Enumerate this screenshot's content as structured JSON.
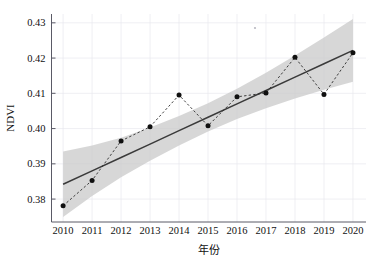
{
  "chart_data": {
    "type": "line",
    "title": "",
    "subtitle": "",
    "xlabel": "年份",
    "ylabel": "NDVI",
    "x": [
      2010,
      2011,
      2012,
      2013,
      2014,
      2015,
      2016,
      2017,
      2018,
      2019,
      2020
    ],
    "categories": [
      "2010",
      "2011",
      "2012",
      "2013",
      "2014",
      "2015",
      "2016",
      "2017",
      "2018",
      "2019",
      "2020"
    ],
    "xlim": [
      2009.6,
      2020.45
    ],
    "ylim": [
      0.3735,
      0.4325
    ],
    "xticks": [
      2010,
      2011,
      2012,
      2013,
      2014,
      2015,
      2016,
      2017,
      2018,
      2019,
      2020
    ],
    "xtick_labels": [
      "2010",
      "2011",
      "2012",
      "2013",
      "2014",
      "2015",
      "2016",
      "2017",
      "2018",
      "2019",
      "2020"
    ],
    "yticks": [
      0.38,
      0.39,
      0.4,
      0.41,
      0.42,
      0.43
    ],
    "ytick_labels": [
      "0.38",
      "0.39",
      "0.40",
      "0.41",
      "0.42",
      "0.43"
    ],
    "grid": true,
    "legend": "none",
    "series": [
      {
        "name": "NDVI",
        "style": "dashed-with-markers",
        "marker": "filled-circle",
        "color": "#101010",
        "values": [
          0.3781,
          0.3853,
          0.3965,
          0.4005,
          0.4095,
          0.4008,
          0.409,
          0.4101,
          0.4202,
          0.4097,
          0.4215
        ]
      },
      {
        "name": "线性趋势",
        "style": "solid",
        "color": "#3a3a3a",
        "values": [
          0.3842,
          0.388,
          0.3918,
          0.3956,
          0.3994,
          0.4032,
          0.407,
          0.4108,
          0.4146,
          0.4184,
          0.4222
        ]
      }
    ],
    "confidence_band": {
      "name": "95%置信区间",
      "color": "#c9c9c9",
      "lower": [
        0.3749,
        0.3809,
        0.3862,
        0.3909,
        0.3952,
        0.3992,
        0.4027,
        0.4058,
        0.4085,
        0.411,
        0.4133
      ],
      "upper": [
        0.3935,
        0.3952,
        0.3974,
        0.4003,
        0.4036,
        0.4072,
        0.4113,
        0.4158,
        0.4207,
        0.4258,
        0.4311
      ]
    },
    "annotations": []
  },
  "axes": {
    "y_axis_label": "NDVI",
    "x_axis_label": "年份"
  }
}
